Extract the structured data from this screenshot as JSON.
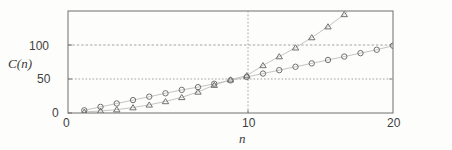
{
  "figure": {
    "kind": "scientific-line-plot",
    "background_color": "#fdfdfc",
    "frame_color": "#6f6f6f",
    "grid_color": "#9a9a9a",
    "marker_color": "#6a6a6a",
    "line_color": "#b3b3b3"
  },
  "chart_data": {
    "type": "line",
    "title": "",
    "subtitle": "",
    "xlabel": "n",
    "ylabel": "C(n)",
    "xlim": [
      0,
      20
    ],
    "ylim": [
      0,
      150
    ],
    "xticks": [
      0,
      10,
      20
    ],
    "xtick_labels": [
      "0",
      "10",
      "20"
    ],
    "yticks": [
      0,
      50,
      100
    ],
    "ytick_labels": [
      "0",
      "50",
      "100"
    ],
    "grid": true,
    "grid_style": "dotted",
    "grid_x_values": [
      10
    ],
    "grid_y_values": [
      50,
      100
    ],
    "legend": "none",
    "legend_position": "none",
    "annotations": [],
    "x": [
      1,
      2,
      3,
      4,
      5,
      6,
      7,
      8,
      9,
      10,
      11,
      12,
      13,
      14,
      15,
      16,
      17,
      18,
      19,
      20
    ],
    "series": [
      {
        "name": "circle-series",
        "marker": "circle",
        "values": [
          4,
          9,
          14,
          19,
          24,
          29,
          34,
          38,
          43,
          48,
          53,
          58,
          63,
          68,
          73,
          78,
          83,
          88,
          93,
          99
        ]
      },
      {
        "name": "triangle-series",
        "marker": "triangle",
        "values": [
          1.5,
          3,
          5,
          8,
          12,
          17,
          23,
          31,
          41,
          49,
          55,
          70,
          83,
          96,
          111,
          127,
          145,
          163,
          182,
          202
        ]
      }
    ]
  }
}
